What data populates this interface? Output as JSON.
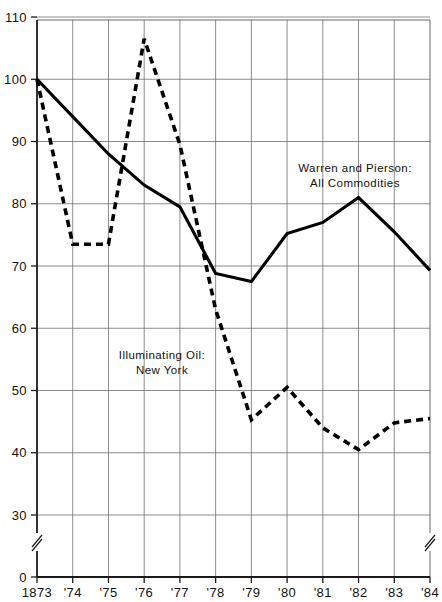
{
  "chart_data": {
    "type": "line",
    "title": "",
    "subtitle": "",
    "xlabel": "",
    "ylabel": "",
    "grid": true,
    "legend_position": "inline-annotations",
    "x": [
      "1873",
      "'74",
      "'75",
      "'76",
      "'77",
      "'78",
      "'79",
      "'80",
      "'81",
      "'82",
      "'83",
      "'84"
    ],
    "xtick_labels": [
      "1873",
      "'74",
      "'75",
      "'76",
      "'77",
      "'78",
      "'79",
      "'80",
      "'81",
      "'82",
      "'83",
      "'84"
    ],
    "ytick_labels": [
      "0",
      "30",
      "40",
      "50",
      "60",
      "70",
      "80",
      "90",
      "100",
      "110"
    ],
    "ytick_values": [
      0,
      30,
      40,
      50,
      60,
      70,
      80,
      90,
      100,
      110
    ],
    "ylim": [
      0,
      110
    ],
    "y_axis_break": true,
    "y_axis_break_between": [
      0,
      30
    ],
    "x_axis_break_marks": [
      "left",
      "right"
    ],
    "series": [
      {
        "name": "Warren and Pierson: All Commodities",
        "style": "solid",
        "color": "#000000",
        "values": [
          100,
          94.0,
          88.0,
          83.0,
          79.5,
          68.8,
          67.5,
          75.2,
          77.0,
          81.0,
          75.5,
          69.3
        ]
      },
      {
        "name": "Illuminating Oil: New York",
        "style": "dashed",
        "color": "#000000",
        "values": [
          100,
          73.5,
          73.5,
          106.5,
          89.5,
          63.0,
          45.3,
          50.5,
          44.0,
          40.5,
          44.8,
          45.5
        ]
      }
    ],
    "annotations": [
      {
        "id": "warren-pierson",
        "lines": [
          "Warren and Pierson:",
          "All Commodities"
        ],
        "x_px": 355,
        "y_px": 172
      },
      {
        "id": "illuminating-oil",
        "lines": [
          "Illuminating Oil:",
          "New York"
        ],
        "x_px": 162,
        "y_px": 359
      }
    ]
  },
  "annotation_warren_line1": "Warren and Pierson:",
  "annotation_warren_line2": "All Commodities",
  "annotation_oil_line1": "Illuminating Oil:",
  "annotation_oil_line2": "New York"
}
